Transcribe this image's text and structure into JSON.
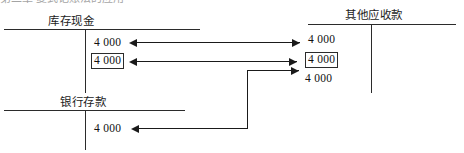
{
  "caption": {
    "text": "第二章 复式记账法的应用"
  },
  "accounts": [
    {
      "id": "cash-on-hand",
      "title": "库存现金",
      "entries": [
        {
          "value": "4 000",
          "boxed": false
        },
        {
          "value": "4 000",
          "boxed": true
        }
      ]
    },
    {
      "id": "bank-deposit",
      "title": "银行存款",
      "entries": [
        {
          "value": "4 000",
          "boxed": false
        }
      ]
    },
    {
      "id": "other-receivables",
      "title": "其他应收款",
      "entries": [
        {
          "value": "4 000",
          "boxed": false
        },
        {
          "value": "4 000",
          "boxed": true
        },
        {
          "value": "4 000",
          "boxed": false
        }
      ]
    }
  ],
  "connectors": [
    {
      "id": "row-1",
      "note": "库存现金 4 000 ← → 其他应收款 4 000"
    },
    {
      "id": "row-2",
      "note": "库存现金 4 000 (boxed) ← → 其他应收款 4 000 (boxed)"
    },
    {
      "id": "row-3",
      "note": "银行存款 4 000 ← 折线 → 其他应收款 4 000"
    }
  ],
  "colors": {
    "ink": "#1a1a1a",
    "rule": "#2b2b2b",
    "background": "#ffffff"
  }
}
